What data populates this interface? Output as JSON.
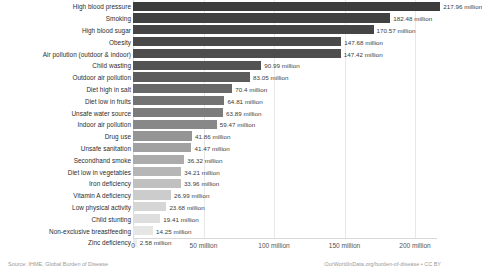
{
  "chart_data": {
    "type": "bar",
    "orientation": "horizontal",
    "title": "",
    "xlabel": "",
    "ylabel": "",
    "xlim": [
      0,
      220
    ],
    "grid": true,
    "legend": "none",
    "unit": "million",
    "categories": [
      "High blood pressure",
      "Smoking",
      "High blood sugar",
      "Obesity",
      "Air pollution (outdoor & indoor)",
      "Child wasting",
      "Outdoor air pollution",
      "Diet high in salt",
      "Diet low in fruits",
      "Unsafe water source",
      "Indoor air pollution",
      "Drug use",
      "Unsafe sanitation",
      "Secondhand smoke",
      "Diet low in vegetables",
      "Iron deficiency",
      "Vitamin A deficiency",
      "Low physical activity",
      "Child stunting",
      "Non-exclusive breastfeeding",
      "Zinc deficiency"
    ],
    "values": [
      217.96,
      182.48,
      170.57,
      147.68,
      147.42,
      90.99,
      83.05,
      70.4,
      64.81,
      63.89,
      59.47,
      41.86,
      41.47,
      36.32,
      34.21,
      33.96,
      26.99,
      23.68,
      19.41,
      14.25,
      2.58
    ],
    "value_labels": [
      "217.96 million",
      "182.48 million",
      "170.57 million",
      "147.68 million",
      "147.42 million",
      "90.99 million",
      "83.05 million",
      "70.4 million",
      "64.81 million",
      "63.89 million",
      "59.47 million",
      "41.86 million",
      "41.47 million",
      "36.32 million",
      "34.21 million",
      "33.96 million",
      "26.99 million",
      "23.68 million",
      "19.41 million",
      "14.25 million",
      "2.58 million"
    ],
    "bar_colors": [
      "#3d3d3d",
      "#414141",
      "#454545",
      "#494949",
      "#4d4d4d",
      "#535353",
      "#5c5c5c",
      "#686868",
      "#737373",
      "#7c7c7c",
      "#888888",
      "#959595",
      "#a1a1a1",
      "#acacac",
      "#b6b6b6",
      "#c0c0c0",
      "#cccccc",
      "#d6d6d6",
      "#dedede",
      "#e6e6e6",
      "#ededed"
    ],
    "xticks": [
      0,
      50,
      100,
      150,
      200
    ],
    "xtick_labels": [
      "0",
      "50 million",
      "100 million",
      "150 million",
      "200 million"
    ]
  },
  "footer": {
    "source": "Source: IHME, Global Burden of Disease",
    "credit": "OurWorldInData.org/burden-of-disease • CC BY"
  }
}
